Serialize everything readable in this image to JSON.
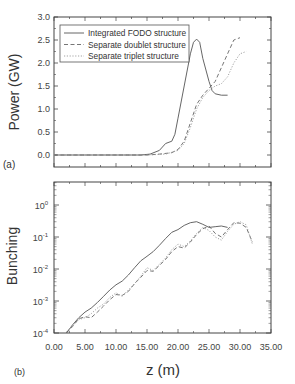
{
  "chart_data": [
    {
      "panel": "(a)",
      "type": "line",
      "title": "",
      "xlabel": "",
      "ylabel": "Power (GW)",
      "xlim": [
        0,
        35
      ],
      "ylim": [
        -0.26,
        3.0
      ],
      "yticks": [
        "0.0",
        "0.5",
        "1.0",
        "1.5",
        "2.0",
        "2.5",
        "3.0"
      ],
      "ytick_values": [
        0.0,
        0.5,
        1.0,
        1.5,
        2.0,
        2.5,
        3.0
      ],
      "xtick_values": [
        0,
        5,
        10,
        15,
        20,
        25,
        30,
        35
      ],
      "grid": false,
      "legend_position": "upper left",
      "legend": [
        "Integrated FODO structure",
        "Separate doublet structure",
        "Separate triplet structure"
      ],
      "series": [
        {
          "name": "Integrated FODO structure",
          "style": "solid",
          "x": [
            0,
            5,
            10,
            14,
            15.5,
            17,
            18,
            19,
            19.5,
            20,
            21,
            22,
            22.5,
            23,
            23.5,
            24,
            25,
            25.5,
            26,
            27,
            28
          ],
          "y": [
            0,
            0,
            0,
            0,
            0.02,
            0.1,
            0.25,
            0.3,
            0.45,
            0.8,
            1.5,
            2.2,
            2.45,
            2.52,
            2.45,
            2.1,
            1.6,
            1.4,
            1.33,
            1.3,
            1.3
          ]
        },
        {
          "name": "Separate doublet structure",
          "style": "dashed",
          "x": [
            0,
            5,
            10,
            15,
            17,
            19,
            20,
            21,
            22,
            23,
            24,
            25,
            26,
            27,
            28,
            29,
            30
          ],
          "y": [
            0,
            0,
            0,
            0,
            0.02,
            0.05,
            0.12,
            0.3,
            0.7,
            1.1,
            1.3,
            1.45,
            1.6,
            1.9,
            2.2,
            2.5,
            2.55
          ]
        },
        {
          "name": "Separate triplet structure",
          "style": "dotted",
          "x": [
            0,
            5,
            10,
            15,
            18,
            20,
            21,
            22,
            23,
            24,
            25,
            26,
            27,
            28,
            29,
            30,
            31
          ],
          "y": [
            0,
            0,
            0,
            0,
            0.02,
            0.1,
            0.25,
            0.6,
            1.0,
            1.25,
            1.4,
            1.5,
            1.55,
            1.7,
            2.0,
            2.2,
            2.25
          ]
        }
      ]
    },
    {
      "panel": "(b)",
      "type": "line",
      "yscale": "log",
      "title": "",
      "xlabel": "z (m)",
      "ylabel": "Bunching",
      "xlim": [
        0,
        35
      ],
      "ylim": [
        0.0001,
        5
      ],
      "xticks": [
        "0.00",
        "5.00",
        "10.00",
        "15.00",
        "20.00",
        "25.00",
        "30.00",
        "35.00"
      ],
      "xtick_values": [
        0,
        5,
        10,
        15,
        20,
        25,
        30,
        35
      ],
      "yticks": [
        "10^-4",
        "10^-3",
        "10^-2",
        "10^-1",
        "10^0"
      ],
      "ytick_exponents": [
        -4,
        -3,
        -2,
        -1,
        0
      ],
      "grid": false,
      "series": [
        {
          "name": "Integrated FODO structure",
          "style": "solid",
          "x": [
            2,
            3,
            4,
            5,
            6,
            7,
            8,
            9,
            10,
            11,
            12,
            13,
            14,
            15,
            16,
            17,
            18,
            19,
            20,
            21,
            22,
            23,
            24,
            25,
            26,
            27,
            28
          ],
          "y": [
            0.0001,
            0.00018,
            0.0003,
            0.00045,
            0.0006,
            0.0009,
            0.0014,
            0.0022,
            0.0032,
            0.0042,
            0.0065,
            0.011,
            0.018,
            0.025,
            0.035,
            0.055,
            0.09,
            0.14,
            0.17,
            0.23,
            0.28,
            0.3,
            0.25,
            0.2,
            0.21,
            0.22,
            0.2
          ]
        },
        {
          "name": "Separate doublet structure",
          "style": "dashed",
          "x": [
            2,
            3,
            4,
            5,
            6,
            7,
            8,
            9,
            10,
            11,
            12,
            13,
            14,
            15,
            16,
            17,
            18,
            19,
            20,
            21,
            22,
            23,
            24,
            25,
            26,
            27,
            28,
            29,
            30,
            31,
            32
          ],
          "y": [
            0.0001,
            0.00016,
            0.00028,
            0.00032,
            0.0003,
            0.00045,
            0.0007,
            0.0011,
            0.0016,
            0.0015,
            0.002,
            0.0035,
            0.0055,
            0.009,
            0.0085,
            0.013,
            0.02,
            0.035,
            0.05,
            0.045,
            0.07,
            0.12,
            0.18,
            0.22,
            0.13,
            0.1,
            0.17,
            0.28,
            0.27,
            0.2,
            0.07
          ]
        },
        {
          "name": "Separate triplet structure",
          "style": "dotted",
          "x": [
            2,
            3,
            4,
            5,
            6,
            7,
            8,
            9,
            10,
            11,
            12,
            13,
            14,
            15,
            16,
            17,
            18,
            19,
            20,
            21,
            22,
            23,
            24,
            25,
            26,
            27,
            28,
            29,
            30,
            31,
            32
          ],
          "y": [
            0.00011,
            0.00017,
            0.00026,
            0.0003,
            0.0004,
            0.0006,
            0.0008,
            0.0013,
            0.0018,
            0.0014,
            0.0022,
            0.0035,
            0.006,
            0.011,
            0.009,
            0.014,
            0.022,
            0.04,
            0.06,
            0.05,
            0.075,
            0.13,
            0.2,
            0.16,
            0.1,
            0.08,
            0.15,
            0.25,
            0.3,
            0.24,
            0.06
          ]
        }
      ]
    }
  ],
  "labels": {
    "panel_a": "(a)",
    "panel_b": "(b)",
    "ylabel_a": "Power (GW)",
    "ylabel_b": "Bunching",
    "xlabel": "z (m)"
  }
}
